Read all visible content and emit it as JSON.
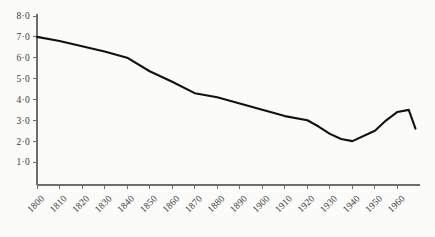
{
  "chart_data": {
    "type": "line",
    "title": "",
    "subtitle": "",
    "xlabel": "",
    "ylabel": "",
    "xlim": [
      1800,
      1970
    ],
    "ylim": [
      0,
      8
    ],
    "grid": false,
    "legend": false,
    "legend_position": "none",
    "decimal_separator": "middle-dot",
    "y_ticks": [
      1.0,
      2.0,
      3.0,
      4.0,
      5.0,
      6.0,
      7.0,
      8.0
    ],
    "y_tick_labels": [
      "1·0",
      "2·0",
      "3·0",
      "4·0",
      "5·0",
      "6·0",
      "7·0",
      "8·0"
    ],
    "x_ticks": [
      1800,
      1810,
      1820,
      1830,
      1840,
      1850,
      1860,
      1870,
      1880,
      1890,
      1900,
      1910,
      1920,
      1930,
      1940,
      1950,
      1960
    ],
    "x_tick_labels": [
      "1800",
      "1810",
      "1820",
      "1830",
      "1840",
      "1850",
      "1860",
      "1870",
      "1880",
      "1890",
      "1900",
      "1910",
      "1920",
      "1930",
      "1940",
      "1950",
      "1960"
    ],
    "x_tick_label_rotation": -45,
    "series": [
      {
        "name": "series-1",
        "color": "#111111",
        "line_width": 2.1,
        "x": [
          1800,
          1810,
          1820,
          1830,
          1840,
          1850,
          1860,
          1870,
          1880,
          1890,
          1900,
          1910,
          1920,
          1925,
          1930,
          1935,
          1940,
          1950,
          1955,
          1960,
          1965,
          1968
        ],
        "values": [
          7.0,
          6.8,
          6.55,
          6.3,
          6.0,
          5.35,
          4.85,
          4.3,
          4.1,
          3.8,
          3.5,
          3.2,
          3.0,
          2.7,
          2.35,
          2.1,
          2.0,
          2.5,
          3.0,
          3.4,
          3.5,
          2.6
        ]
      }
    ],
    "axis_color": "#6d6d6d",
    "background_color": "#fbfbf9"
  },
  "figure": {
    "width": 435,
    "height": 237,
    "plot_left": 37,
    "plot_right": 420,
    "plot_top": 16,
    "plot_bottom": 185
  }
}
